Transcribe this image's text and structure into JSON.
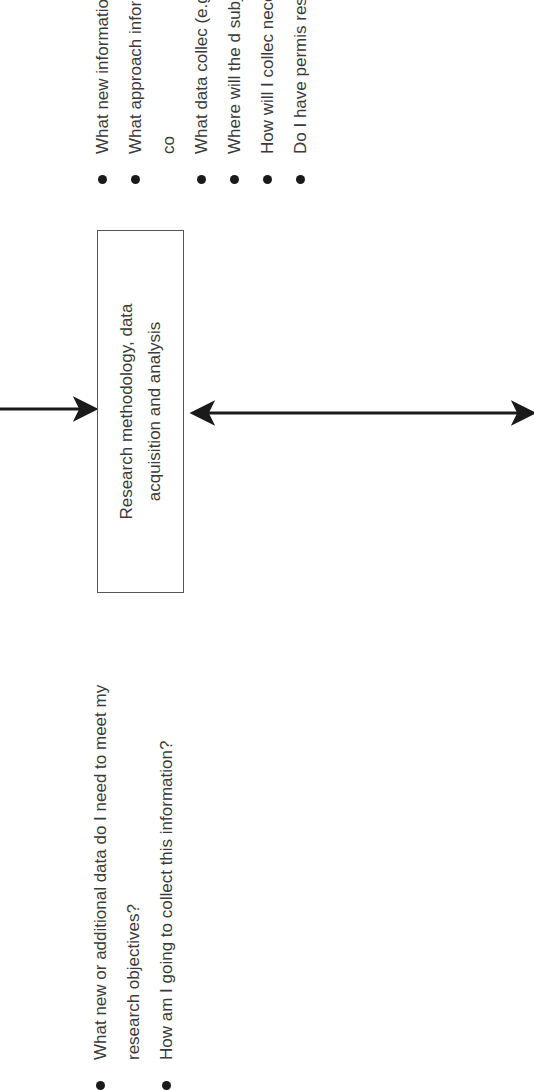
{
  "diagram": {
    "central_box": {
      "label": "Research methodology, data acquisition and analysis"
    },
    "left_list": {
      "items": [
        {
          "text": "What new or additional data do I need to meet my research objectives?"
        },
        {
          "text": "How am I going to collect this information?"
        }
      ]
    },
    "right_list": {
      "items": [
        {
          "text": "What new information variables I intend"
        },
        {
          "text": "What approach information? (e.g. experimental? co"
        },
        {
          "text": "What data collec (e.g., observatio"
        },
        {
          "text": "Where will the d subjects are nee"
        },
        {
          "text": "How will I collec necessary data?"
        },
        {
          "text": "Do I have permis research?"
        }
      ]
    },
    "arrows": [
      {
        "name": "incoming-arrow",
        "from": "top-edge",
        "to": "central_box",
        "heads": "end"
      },
      {
        "name": "bidirectional-arrow",
        "from": "central_box",
        "to": "bottom-edge",
        "heads": "both"
      }
    ],
    "colors": {
      "text": "#3a3a3a",
      "box_border": "#555555",
      "arrow": "#1a1a1a",
      "background": "#ffffff"
    },
    "orientation": "rotated -90deg"
  }
}
